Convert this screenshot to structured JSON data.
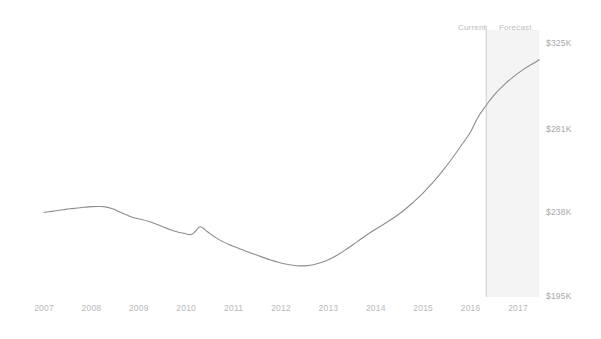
{
  "chart_data": {
    "type": "line",
    "title": "",
    "subtitle": "",
    "xlabel": "",
    "ylabel": "",
    "grid": false,
    "legend_position": "none",
    "xlim": [
      2006.7,
      2017.5
    ],
    "ylim": [
      195,
      325
    ],
    "x_tick_labels": [
      "2007",
      "2008",
      "2009",
      "2010",
      "2011",
      "2012",
      "2013",
      "2014",
      "2015",
      "2016",
      "2017"
    ],
    "x_tick_values": [
      2007,
      2008,
      2009,
      2010,
      2011,
      2012,
      2013,
      2014,
      2015,
      2016,
      2017
    ],
    "y_tick_labels": [
      "$325K",
      "$281K",
      "$238K",
      "$195K"
    ],
    "y_tick_values": [
      325,
      281,
      238,
      195
    ],
    "annotations": [
      {
        "label": "Current",
        "x": 2016.2,
        "align": "right"
      },
      {
        "label": "Forecast",
        "x": 2016.45,
        "align": "left"
      }
    ],
    "forecast_start_x": 2016.33,
    "forecast_end_x": 2017.45,
    "series": [
      {
        "name": "Median home value",
        "color": "#8d8d8d",
        "x": [
          2007.0,
          2007.1,
          2007.25,
          2007.4,
          2007.55,
          2007.7,
          2007.85,
          2008.0,
          2008.15,
          2008.3,
          2008.45,
          2008.6,
          2008.75,
          2008.9,
          2009.05,
          2009.2,
          2009.35,
          2009.5,
          2009.65,
          2009.8,
          2009.95,
          2010.1,
          2010.2,
          2010.3,
          2010.45,
          2010.6,
          2010.75,
          2010.9,
          2011.05,
          2011.2,
          2011.35,
          2011.5,
          2011.65,
          2011.8,
          2011.95,
          2012.1,
          2012.25,
          2012.4,
          2012.55,
          2012.7,
          2012.85,
          2013.0,
          2013.2,
          2013.4,
          2013.6,
          2013.8,
          2014.0,
          2014.2,
          2014.4,
          2014.6,
          2014.8,
          2015.0,
          2015.2,
          2015.4,
          2015.6,
          2015.8,
          2016.0,
          2016.15,
          2016.33,
          2016.5,
          2016.7,
          2016.9,
          2017.1,
          2017.3,
          2017.45
        ],
        "values": [
          238.0,
          238.3,
          238.8,
          239.3,
          239.8,
          240.2,
          240.6,
          240.9,
          241.0,
          240.8,
          239.8,
          238.2,
          236.6,
          235.2,
          234.4,
          233.4,
          232.1,
          230.6,
          229.2,
          228.0,
          227.2,
          226.6,
          228.4,
          230.6,
          228.0,
          225.4,
          223.2,
          221.4,
          220.0,
          218.6,
          217.2,
          215.9,
          214.6,
          213.4,
          212.3,
          211.4,
          210.8,
          210.5,
          210.6,
          211.2,
          212.2,
          213.6,
          216.2,
          219.4,
          222.8,
          226.2,
          229.4,
          232.4,
          235.6,
          239.2,
          243.4,
          248.0,
          253.2,
          259.0,
          265.4,
          272.2,
          279.4,
          286.6,
          293.0,
          298.4,
          303.4,
          307.6,
          311.2,
          314.2,
          316.4
        ]
      }
    ]
  },
  "colors": {
    "line": "#8d8d8d",
    "forecast_band": "#f2f2f2",
    "divider": "#cfcfcf",
    "tick_text": "#b8b8b8",
    "background": "#ffffff"
  }
}
